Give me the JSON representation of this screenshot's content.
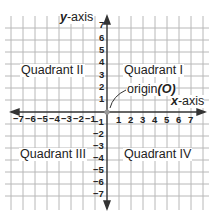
{
  "diagram": {
    "axes": {
      "x_label_var": "x",
      "x_label_rest": "-axis",
      "y_label_var": "y",
      "y_label_rest": "-axis",
      "range_min": -7,
      "range_max": 7
    },
    "origin": {
      "label_text": "origin",
      "label_symbol": "(O)"
    },
    "quadrants": {
      "q1": "Quadrant I",
      "q2": "Quadrant II",
      "q3": "Quadrant III",
      "q4": "Quadrant IV"
    },
    "x_ticks_neg": [
      "−7",
      "−6",
      "−5",
      "−4",
      "−3",
      "−2",
      "−1"
    ],
    "x_ticks_pos": [
      "1",
      "2",
      "3",
      "4",
      "5",
      "6",
      "7"
    ],
    "y_ticks_pos": [
      "7",
      "6",
      "5",
      "4",
      "3",
      "2",
      "1"
    ],
    "y_ticks_neg": [
      "−1",
      "−2",
      "−3",
      "−4",
      "−5",
      "−6",
      "−7"
    ],
    "colors": {
      "grid": "#b8b8b8",
      "axis": "#333333",
      "origin_dot": "#999999",
      "text": "#222222"
    }
  }
}
